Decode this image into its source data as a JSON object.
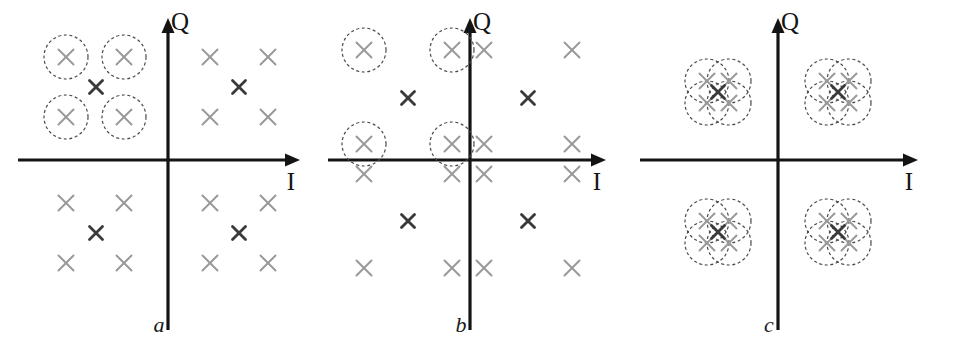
{
  "figure": {
    "panel_count": 3,
    "background_color": "#ffffff"
  },
  "style": {
    "axis_color": "#141414",
    "axis_width": 3.2,
    "marker_light_color": "#9a9a9a",
    "marker_dark_color": "#3a3a3a",
    "circle_color": "#4a4a4a",
    "circle_dash": "3,2.6",
    "circle_width": 1.2,
    "marker_size_light": 7.5,
    "marker_size_dark": 6.5,
    "marker_stroke_light": 2.0,
    "marker_stroke_dark": 2.8
  },
  "chart_data": {
    "type": "scatter",
    "xlabel": "I",
    "ylabel": "Q",
    "grid": false,
    "legend": null,
    "axis_labels": {
      "x": "I",
      "y": "Q"
    },
    "panels": [
      {
        "id": "a",
        "caption": "a",
        "origin": {
          "x": 168,
          "y": 160
        },
        "x_axis": {
          "x1": 18,
          "x2": 300,
          "y": 160,
          "arrow": "right"
        },
        "y_axis": {
          "y1": 330,
          "y2": 18,
          "x": 168,
          "arrow": "up"
        },
        "x_label_pos": {
          "x": 291,
          "y": 190
        },
        "y_label_pos": {
          "x": 180,
          "y": 30
        },
        "caption_pos": {
          "x": 159,
          "y": 332
        },
        "light_markers": [
          {
            "x": 66,
            "y": 57
          },
          {
            "x": 124,
            "y": 57
          },
          {
            "x": 66,
            "y": 117
          },
          {
            "x": 124,
            "y": 117
          },
          {
            "x": 210,
            "y": 57
          },
          {
            "x": 268,
            "y": 57
          },
          {
            "x": 210,
            "y": 117
          },
          {
            "x": 268,
            "y": 117
          },
          {
            "x": 66,
            "y": 203
          },
          {
            "x": 124,
            "y": 203
          },
          {
            "x": 66,
            "y": 263
          },
          {
            "x": 124,
            "y": 263
          },
          {
            "x": 210,
            "y": 203
          },
          {
            "x": 268,
            "y": 203
          },
          {
            "x": 210,
            "y": 263
          },
          {
            "x": 268,
            "y": 263
          }
        ],
        "dark_markers": [
          {
            "x": 96,
            "y": 87
          },
          {
            "x": 239,
            "y": 87
          },
          {
            "x": 96,
            "y": 233
          },
          {
            "x": 239,
            "y": 233
          }
        ],
        "circles": [
          {
            "x": 66,
            "y": 57,
            "r": 22
          },
          {
            "x": 124,
            "y": 57,
            "r": 22
          },
          {
            "x": 66,
            "y": 117,
            "r": 22
          },
          {
            "x": 124,
            "y": 117,
            "r": 22
          }
        ]
      },
      {
        "id": "b",
        "caption": "b",
        "origin": {
          "x": 152,
          "y": 160
        },
        "x_axis": {
          "x1": 10,
          "x2": 288,
          "y": 160,
          "arrow": "right"
        },
        "y_axis": {
          "y1": 330,
          "y2": 18,
          "x": 152,
          "arrow": "up"
        },
        "x_label_pos": {
          "x": 279,
          "y": 190
        },
        "y_label_pos": {
          "x": 164,
          "y": 30
        },
        "caption_pos": {
          "x": 143,
          "y": 332
        },
        "light_markers": [
          {
            "x": 46,
            "y": 50
          },
          {
            "x": 134,
            "y": 50
          },
          {
            "x": 166,
            "y": 50
          },
          {
            "x": 254,
            "y": 50
          },
          {
            "x": 46,
            "y": 144
          },
          {
            "x": 134,
            "y": 144
          },
          {
            "x": 166,
            "y": 144
          },
          {
            "x": 254,
            "y": 144
          },
          {
            "x": 46,
            "y": 174
          },
          {
            "x": 134,
            "y": 174
          },
          {
            "x": 166,
            "y": 174
          },
          {
            "x": 254,
            "y": 174
          },
          {
            "x": 46,
            "y": 268
          },
          {
            "x": 134,
            "y": 268
          },
          {
            "x": 166,
            "y": 268
          },
          {
            "x": 254,
            "y": 268
          }
        ],
        "dark_markers": [
          {
            "x": 90,
            "y": 98
          },
          {
            "x": 210,
            "y": 98
          },
          {
            "x": 90,
            "y": 221
          },
          {
            "x": 210,
            "y": 221
          }
        ],
        "circles": [
          {
            "x": 46,
            "y": 50,
            "r": 22
          },
          {
            "x": 134,
            "y": 50,
            "r": 22
          },
          {
            "x": 46,
            "y": 144,
            "r": 22
          },
          {
            "x": 134,
            "y": 144,
            "r": 22
          }
        ]
      },
      {
        "id": "c",
        "caption": "c",
        "origin": {
          "x": 142,
          "y": 160
        },
        "x_axis": {
          "x1": 4,
          "x2": 282,
          "y": 160,
          "arrow": "right"
        },
        "y_axis": {
          "y1": 330,
          "y2": 18,
          "x": 142,
          "arrow": "up"
        },
        "x_label_pos": {
          "x": 273,
          "y": 190
        },
        "y_label_pos": {
          "x": 154,
          "y": 30
        },
        "caption_pos": {
          "x": 133,
          "y": 332
        },
        "cluster_centers": [
          {
            "x": 82,
            "y": 92
          },
          {
            "x": 202,
            "y": 92
          },
          {
            "x": 82,
            "y": 232
          },
          {
            "x": 202,
            "y": 232
          }
        ],
        "cluster_offsets": [
          {
            "dx": -11,
            "dy": -11
          },
          {
            "dx": 11,
            "dy": -11
          },
          {
            "dx": -11,
            "dy": 11
          },
          {
            "dx": 11,
            "dy": 11
          }
        ],
        "cluster_circle_radius": 22,
        "cluster_dark_marker_offset": {
          "dx": 0,
          "dy": 0
        }
      }
    ]
  }
}
